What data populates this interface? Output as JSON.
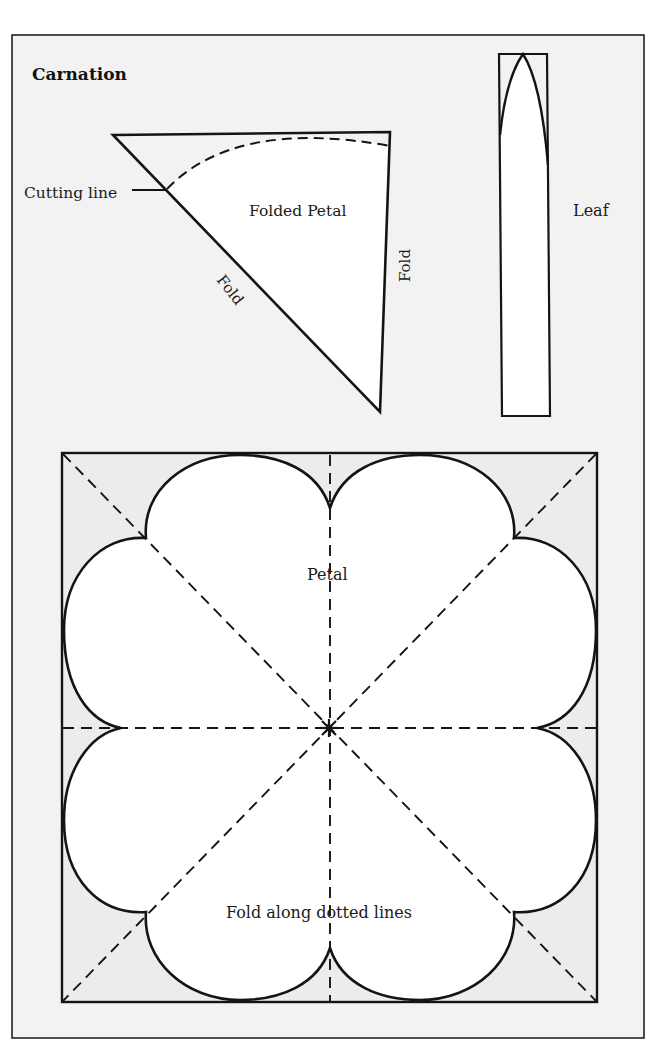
{
  "title": "Carnation",
  "colors": {
    "page_background": "#ffffff",
    "panel_background": "#f2f2f2",
    "shape_fill": "#ffffff",
    "stroke": "#141414"
  },
  "folded_petal": {
    "label": "Folded Petal",
    "cutting_line_label": "Cutting line",
    "fold_label_diagonal": "Fold",
    "fold_label_vertical": "Fold"
  },
  "leaf": {
    "label": "Leaf"
  },
  "petal": {
    "label": "Petal",
    "instruction": "Fold along dotted lines",
    "center_marker": "asterisk"
  }
}
